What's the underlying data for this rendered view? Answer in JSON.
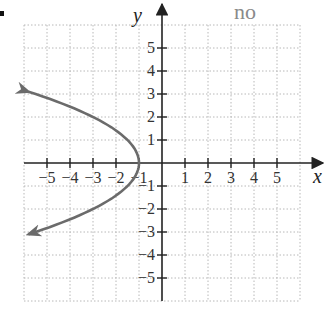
{
  "answer_label": "no",
  "chart_data": {
    "type": "line",
    "title": "",
    "xlabel": "x",
    "ylabel": "y",
    "xlim": [
      -6,
      6
    ],
    "ylim": [
      -6,
      6
    ],
    "grid": true,
    "x_ticks": [
      -5,
      -4,
      -3,
      -2,
      -1,
      1,
      2,
      3,
      4,
      5
    ],
    "y_ticks": [
      5,
      4,
      3,
      2,
      1,
      -1,
      -2,
      -3,
      -4,
      -5
    ],
    "x_tick_labels": [
      "−5",
      "−4",
      "−3",
      "−2",
      "−1",
      "1",
      "2",
      "3",
      "4",
      "5"
    ],
    "y_tick_labels": [
      "5",
      "4",
      "3",
      "2",
      "1",
      "−1",
      "−2",
      "−3",
      "−4",
      "−5"
    ],
    "series": [
      {
        "name": "sideways parabola x = -1 - 0.5y^2",
        "color": "#6b6b6b",
        "vertex": [
          -1,
          0
        ],
        "arrows_at_ends": true,
        "points": [
          [
            -5.8,
            3.1
          ],
          [
            -5.5,
            3.0
          ],
          [
            -4.1,
            2.5
          ],
          [
            -3.0,
            2.0
          ],
          [
            -2.1,
            1.5
          ],
          [
            -1.5,
            1.0
          ],
          [
            -1.125,
            0.5
          ],
          [
            -1.0,
            0.0
          ],
          [
            -1.125,
            -0.5
          ],
          [
            -1.5,
            -1.0
          ],
          [
            -2.1,
            -1.5
          ],
          [
            -3.0,
            -2.0
          ],
          [
            -4.1,
            -2.5
          ],
          [
            -5.5,
            -3.0
          ],
          [
            -5.8,
            -3.1
          ]
        ]
      }
    ],
    "annotations": [
      {
        "text": "no",
        "position": "top-right",
        "color": "#8a8a8a"
      }
    ]
  },
  "colors": {
    "grid": "#b8b8b8",
    "axis": "#222222",
    "curve": "#6b6b6b",
    "answer": "#8a8a8a"
  }
}
